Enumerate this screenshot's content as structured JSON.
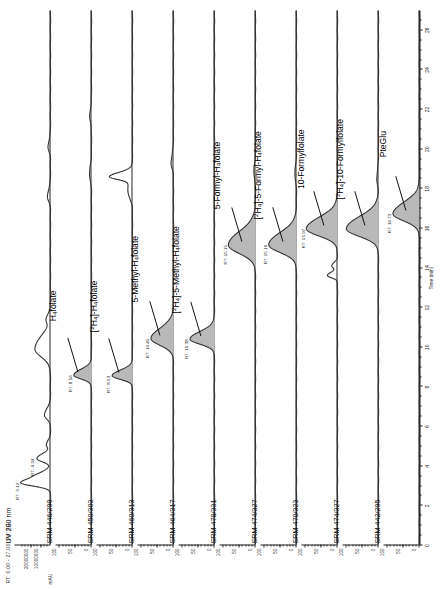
{
  "figure": {
    "rt_header": "RT: 0.00 - 27.00  SM: 9G",
    "uv_y_unit": "mAU"
  },
  "xaxis": {
    "title": "Time (min)",
    "min": 0,
    "max": 27,
    "major_step": 2,
    "ticks": [
      "0",
      "2",
      "4",
      "6",
      "8",
      "10",
      "12",
      "14",
      "16",
      "18",
      "20",
      "22",
      "24",
      "26"
    ]
  },
  "panels": [
    {
      "id": "uv-280",
      "channel_label": "UV 280 nm",
      "y_ticks": [
        "10000000",
        "20000000"
      ],
      "y_unit": "mAU",
      "compound": "",
      "rt_labels": [
        {
          "text": "RT: 3.12",
          "t": 3.12,
          "h": 0.88
        },
        {
          "text": "RT: 4.34",
          "t": 4.34,
          "h": 0.4
        }
      ]
    },
    {
      "id": "srm-446-299",
      "channel_label": "SRM 446/299",
      "y_ticks": [
        "0",
        "50",
        "100"
      ],
      "compound": "H<sub>4</sub>folate",
      "compound_t": 8.56,
      "rt_labels": [
        {
          "text": "RT: 8.56",
          "t": 8.56,
          "h": 0.52
        }
      ]
    },
    {
      "id": "srm-450-303",
      "channel_label": "SRM 450/303",
      "y_ticks": [
        "0",
        "50",
        "100"
      ],
      "compound": "[<sup>2</sup>H<sub>4</sub>]-H<sub>4</sub>folate",
      "compound_t": 8.53,
      "rt_labels": [
        {
          "text": "RT: 8.53",
          "t": 8.53,
          "h": 0.6
        }
      ]
    },
    {
      "id": "srm-460-313",
      "channel_label": "SRM 460/313",
      "y_ticks": [
        "0",
        "50",
        "100"
      ],
      "compound": "5-Methyl-H<sub>4</sub>folate",
      "compound_t": 10.41,
      "rt_labels": [
        {
          "text": "RT: 10.41",
          "t": 10.41,
          "h": 0.66
        }
      ]
    },
    {
      "id": "srm-464-317",
      "channel_label": "SRM 464/317",
      "y_ticks": [
        "0",
        "50",
        "100"
      ],
      "compound": "[<sup>2</sup>H<sub>4</sub>]-5-Methyl-H<sub>4</sub>folate",
      "compound_t": 10.38,
      "rt_labels": [
        {
          "text": "RT: 10.38",
          "t": 10.38,
          "h": 0.72
        }
      ]
    },
    {
      "id": "srm-478-331",
      "channel_label": "SRM 478/331",
      "y_ticks": [
        "0",
        "50",
        "100"
      ],
      "compound": "5-Formyl-H<sub>4</sub>folate",
      "compound_t": 15.15,
      "rt_labels": [
        {
          "text": "RT: 15.15",
          "t": 15.15,
          "h": 0.8
        }
      ]
    },
    {
      "id": "srm-474-327-a",
      "channel_label": "SRM 474/327",
      "y_ticks": [
        "0",
        "50",
        "100"
      ],
      "compound": "[<sup>2</sup>H<sub>4</sub>]-5-Formyl-H<sub>4</sub>folate",
      "compound_t": 15.16,
      "rt_labels": [
        {
          "text": "RT: 15.16",
          "t": 15.16,
          "h": 0.82
        }
      ]
    },
    {
      "id": "srm-470-323",
      "channel_label": "SRM 470/323",
      "y_ticks": [
        "0",
        "50",
        "100"
      ],
      "compound": "10-Formylfolate",
      "compound_t": 15.97,
      "rt_labels": [
        {
          "text": "RT: 15.97",
          "t": 15.97,
          "h": 0.92
        }
      ]
    },
    {
      "id": "srm-474-327-b",
      "channel_label": "SRM 474/327",
      "y_ticks": [
        "0",
        "50",
        "100"
      ],
      "compound": "[<sup>2</sup>H<sub>4</sub>]-10-Formylfolate",
      "compound_t": 15.97,
      "rt_labels": []
    },
    {
      "id": "srm-442-295",
      "channel_label": "SRM 442/295",
      "y_ticks": [
        "0",
        "50",
        "100"
      ],
      "compound": "PteGlu",
      "compound_t": 16.73,
      "rt_labels": [
        {
          "text": "RT: 16.73",
          "t": 16.73,
          "h": 0.78
        }
      ]
    }
  ],
  "chart_data": {
    "type": "line",
    "xlabel": "Time (min)",
    "ylabel": "Relative Abundance",
    "xlim": [
      0,
      27
    ],
    "grid": false,
    "legend": "none",
    "x_ticks": [
      0,
      2,
      4,
      6,
      8,
      10,
      12,
      14,
      16,
      18,
      20,
      22,
      24,
      26
    ],
    "series": [
      {
        "name": "UV 280 nm",
        "channel": "UV 280 nm",
        "ylim": [
          0,
          25000000
        ],
        "y_ticks": [
          10000000,
          20000000
        ],
        "yunit": "mAU",
        "peaks": [
          {
            "rt": 3.12,
            "rel_height": 0.88,
            "width": 0.35,
            "labelled": true
          },
          {
            "rt": 3.55,
            "rel_height": 0.22,
            "width": 0.3,
            "labelled": false
          },
          {
            "rt": 4.34,
            "rel_height": 0.4,
            "width": 0.35,
            "labelled": true
          },
          {
            "rt": 5.05,
            "rel_height": 0.12,
            "width": 0.3,
            "labelled": false
          },
          {
            "rt": 6.55,
            "rel_height": 0.18,
            "width": 0.45,
            "labelled": false
          },
          {
            "rt": 9.9,
            "rel_height": 0.46,
            "width": 0.9,
            "labelled": false
          },
          {
            "rt": 11.4,
            "rel_height": 0.1,
            "width": 0.4,
            "labelled": false
          },
          {
            "rt": 17.6,
            "rel_height": 0.09,
            "width": 0.5,
            "labelled": false
          },
          {
            "rt": 20.1,
            "rel_height": 0.07,
            "width": 0.5,
            "labelled": false
          }
        ]
      },
      {
        "name": "H4folate",
        "channel": "SRM 446/299",
        "ylim": [
          0,
          100
        ],
        "y_ticks": [
          0,
          50,
          100
        ],
        "peaks": [
          {
            "rt": 8.56,
            "rel_height": 0.52,
            "width": 0.42,
            "labelled": true,
            "filled": true
          },
          {
            "rt": 18.7,
            "rel_height": 0.06,
            "width": 0.6,
            "labelled": false
          },
          {
            "rt": 21.6,
            "rel_height": 0.05,
            "width": 0.6,
            "labelled": false
          }
        ]
      },
      {
        "name": "[2H4]-H4folate",
        "channel": "SRM 450/303",
        "ylim": [
          0,
          100
        ],
        "y_ticks": [
          0,
          50,
          100
        ],
        "peaks": [
          {
            "rt": 8.53,
            "rel_height": 0.6,
            "width": 0.4,
            "labelled": true,
            "filled": true
          },
          {
            "rt": 18.6,
            "rel_height": 0.62,
            "width": 0.3,
            "labelled": false
          },
          {
            "rt": 17.9,
            "rel_height": 0.14,
            "width": 0.8,
            "labelled": false
          }
        ]
      },
      {
        "name": "5-Methyl-H4folate",
        "channel": "SRM 460/313",
        "ylim": [
          0,
          100
        ],
        "y_ticks": [
          0,
          50,
          100
        ],
        "peaks": [
          {
            "rt": 10.41,
            "rel_height": 0.66,
            "width": 0.75,
            "labelled": true,
            "filled": true
          },
          {
            "rt": 19.3,
            "rel_height": 0.07,
            "width": 0.6,
            "labelled": false
          }
        ]
      },
      {
        "name": "[2H4]-5-Methyl-H4folate",
        "channel": "SRM 464/317",
        "ylim": [
          0,
          100
        ],
        "y_ticks": [
          0,
          50,
          100
        ],
        "peaks": [
          {
            "rt": 10.38,
            "rel_height": 0.72,
            "width": 0.55,
            "labelled": true,
            "filled": true
          }
        ]
      },
      {
        "name": "5-Formyl-H4folate",
        "channel": "SRM 478/331",
        "ylim": [
          0,
          100
        ],
        "y_ticks": [
          0,
          50,
          100
        ],
        "peaks": [
          {
            "rt": 15.15,
            "rel_height": 0.8,
            "width": 0.95,
            "labelled": true,
            "filled": true
          },
          {
            "rt": 18.8,
            "rel_height": 0.05,
            "width": 0.6,
            "labelled": false
          }
        ]
      },
      {
        "name": "[2H4]-5-Formyl-H4folate",
        "channel": "SRM 474/327",
        "ylim": [
          0,
          100
        ],
        "y_ticks": [
          0,
          50,
          100
        ],
        "peaks": [
          {
            "rt": 15.16,
            "rel_height": 0.82,
            "width": 0.85,
            "labelled": true,
            "filled": true
          },
          {
            "rt": 18.7,
            "rel_height": 0.05,
            "width": 0.6,
            "labelled": false
          }
        ]
      },
      {
        "name": "10-Formylfolate",
        "channel": "SRM 470/323",
        "ylim": [
          0,
          100
        ],
        "y_ticks": [
          0,
          50,
          100
        ],
        "peaks": [
          {
            "rt": 15.97,
            "rel_height": 0.92,
            "width": 0.8,
            "labelled": true,
            "filled": true
          },
          {
            "rt": 13.6,
            "rel_height": 0.3,
            "width": 0.25,
            "labelled": false
          },
          {
            "rt": 14.1,
            "rel_height": 0.16,
            "width": 0.25,
            "labelled": false
          }
        ]
      },
      {
        "name": "[2H4]-10-Formylfolate",
        "channel": "SRM 474/327",
        "ylim": [
          0,
          100
        ],
        "y_ticks": [
          0,
          50,
          100
        ],
        "peaks": [
          {
            "rt": 15.97,
            "rel_height": 0.95,
            "width": 0.85,
            "labelled": false,
            "filled": true
          },
          {
            "rt": 18.5,
            "rel_height": 0.05,
            "width": 0.6,
            "labelled": false
          }
        ]
      },
      {
        "name": "PteGlu",
        "channel": "SRM 442/295",
        "ylim": [
          0,
          100
        ],
        "y_ticks": [
          0,
          50,
          100
        ],
        "peaks": [
          {
            "rt": 16.73,
            "rel_height": 0.78,
            "width": 0.8,
            "labelled": true,
            "filled": true
          }
        ]
      }
    ]
  }
}
